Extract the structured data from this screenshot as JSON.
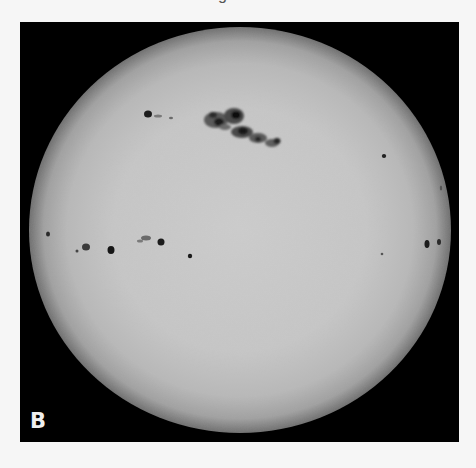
{
  "figure": {
    "panel_label": "B",
    "top_clipped_text": "g",
    "colors": {
      "page_background": "#f6f6f6",
      "frame_background": "#000000",
      "sun_center": "#cbcbcb",
      "sun_mid": "#c2c2c2",
      "sun_limb": "#7a7a7a",
      "sunspot_umbra": "#1a1a1a",
      "sunspot_penumbra": "#5a5a5a",
      "label_color": "#efefef"
    },
    "sun_disc": {
      "cx": 220,
      "cy": 208,
      "rx": 211,
      "ry": 203
    }
  }
}
